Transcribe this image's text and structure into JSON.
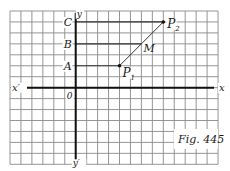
{
  "figure": {
    "caption": "Fig. 445",
    "grid": {
      "x0": 10,
      "y0": 11,
      "cell": 10.95,
      "cols": 19,
      "rows": 14,
      "color": "#8a8a8a"
    },
    "axes": {
      "origin_col": 6,
      "origin_row": 7,
      "x_label": "x",
      "x_neg_label": "x′",
      "y_label": "y",
      "y_neg_label": "y′",
      "origin_label": "0"
    },
    "points": [
      {
        "name": "P1",
        "label": "P",
        "sub": "1",
        "col": 10,
        "row": 5
      },
      {
        "name": "P2",
        "label": "P",
        "sub": "2",
        "col": 14,
        "row": 1
      }
    ],
    "midpoint": {
      "label": "M"
    },
    "y_axis_marks": [
      {
        "label": "A",
        "row": 5
      },
      {
        "label": "B",
        "row": 3
      },
      {
        "label": "C",
        "row": 1
      }
    ]
  }
}
